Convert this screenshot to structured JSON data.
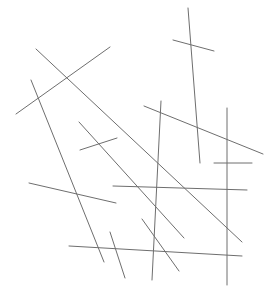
{
  "canvas": {
    "width": 275,
    "height": 296,
    "background": "#ffffff",
    "stroke_color": "#6e6e6e",
    "stroke_width": 1
  },
  "lines": [
    {
      "x1": 16,
      "y1": 114,
      "x2": 110,
      "y2": 47
    },
    {
      "x1": 36,
      "y1": 49,
      "x2": 242,
      "y2": 242
    },
    {
      "x1": 31,
      "y1": 80,
      "x2": 104,
      "y2": 262
    },
    {
      "x1": 188,
      "y1": 8,
      "x2": 200,
      "y2": 163
    },
    {
      "x1": 173,
      "y1": 40,
      "x2": 214,
      "y2": 51
    },
    {
      "x1": 144,
      "y1": 106,
      "x2": 263,
      "y2": 154
    },
    {
      "x1": 161,
      "y1": 101,
      "x2": 152,
      "y2": 280
    },
    {
      "x1": 227,
      "y1": 108,
      "x2": 227,
      "y2": 285
    },
    {
      "x1": 214,
      "y1": 163,
      "x2": 252,
      "y2": 163
    },
    {
      "x1": 79,
      "y1": 122,
      "x2": 184,
      "y2": 238
    },
    {
      "x1": 80,
      "y1": 150,
      "x2": 117,
      "y2": 138
    },
    {
      "x1": 29,
      "y1": 183,
      "x2": 116,
      "y2": 203
    },
    {
      "x1": 113,
      "y1": 186,
      "x2": 247,
      "y2": 190
    },
    {
      "x1": 69,
      "y1": 246,
      "x2": 242,
      "y2": 256
    },
    {
      "x1": 110,
      "y1": 232,
      "x2": 125,
      "y2": 278
    },
    {
      "x1": 142,
      "y1": 219,
      "x2": 179,
      "y2": 271
    }
  ]
}
